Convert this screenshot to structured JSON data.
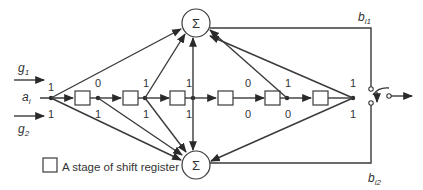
{
  "inputs": {
    "g1": {
      "base": "g",
      "sub": "1"
    },
    "g2": {
      "base": "g",
      "sub": "2"
    },
    "ai": {
      "base": "a",
      "sub": "i"
    }
  },
  "summers": {
    "top_symbol": "Σ",
    "bottom_symbol": "Σ"
  },
  "outputs": {
    "b_i1": {
      "base": "b",
      "sub": "i1"
    },
    "b_i2": {
      "base": "b",
      "sub": "i2"
    }
  },
  "shift_register_stages": 6,
  "g1_coefficients": [
    "1",
    "0",
    "1",
    "1",
    "0",
    "1",
    "1"
  ],
  "g2_coefficients": [
    "1",
    "1",
    "1",
    "1",
    "0",
    "0",
    "1"
  ],
  "legend": {
    "label": "A stage of shift register"
  },
  "colors": {
    "line": "#3a3a3a",
    "text": "#333333",
    "background": "#ffffff"
  }
}
